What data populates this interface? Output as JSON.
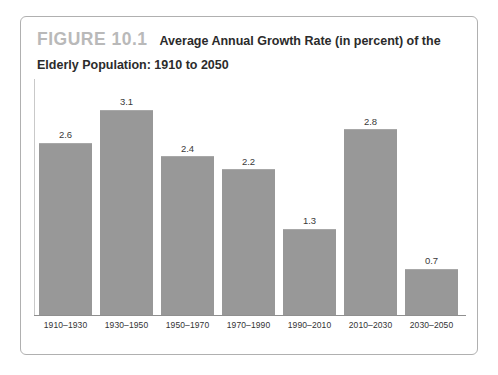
{
  "figure": {
    "label": "FIGURE 10.1",
    "caption": "Average Annual Growth Rate (in percent) of the Elderly Population: 1910 to 2050"
  },
  "colors": {
    "bar_fill": "#989898",
    "bar_top_edge": "#a8a8a8",
    "axis_line": "#8f8f8f",
    "y_axis_line": "#c9c9c9",
    "frame_border": "#b0b0b0",
    "label_gray": "#b9b9b9",
    "caption_text": "#2b2b2b",
    "value_text": "#3a3a3a",
    "tick_text": "#333333",
    "background": "#ffffff"
  },
  "chart_data": {
    "type": "bar",
    "title": "Average Annual Growth Rate (in percent) of the Elderly Population: 1910 to 2050",
    "xlabel": "",
    "ylabel": "",
    "ylim": [
      0,
      3.35
    ],
    "grid": false,
    "legend": false,
    "categories": [
      "1910–1930",
      "1930–1950",
      "1950–1970",
      "1970–1990",
      "1990–2010",
      "2010–2030",
      "2030–2050"
    ],
    "values": [
      2.6,
      3.1,
      2.4,
      2.2,
      1.3,
      2.8,
      0.7
    ],
    "value_labels": [
      "2.6",
      "3.1",
      "2.4",
      "2.2",
      "1.3",
      "2.8",
      "0.7"
    ]
  }
}
